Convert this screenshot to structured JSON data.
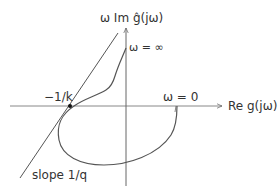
{
  "figure": {
    "type": "Popov plot",
    "axes": {
      "y_label": "ω Im ĝ(jω)",
      "x_label": "Re g(jω)"
    },
    "annotations": {
      "omega_infinity": "ω = ∞",
      "omega_zero": "ω = 0",
      "critical_point": "−1/k",
      "popov_line": "slope 1/q"
    },
    "colors": {
      "line": "#555555",
      "axis": "#666666",
      "text": "#333333",
      "point": "#111111"
    }
  }
}
